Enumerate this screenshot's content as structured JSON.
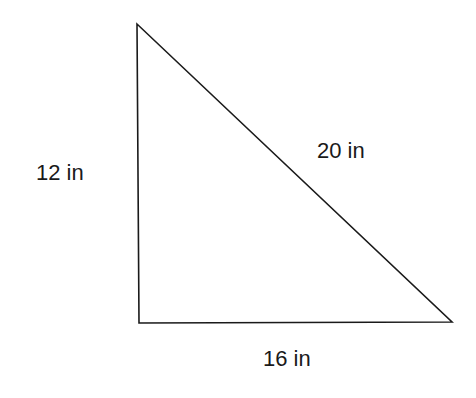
{
  "diagram": {
    "type": "right-triangle",
    "stroke_color": "#1a1a1a",
    "sides": {
      "left": {
        "label": "12 in",
        "value": 12,
        "unit": "in"
      },
      "hypotenuse": {
        "label": "20 in",
        "value": 20,
        "unit": "in"
      },
      "bottom": {
        "label": "16 in",
        "value": 16,
        "unit": "in"
      }
    }
  }
}
